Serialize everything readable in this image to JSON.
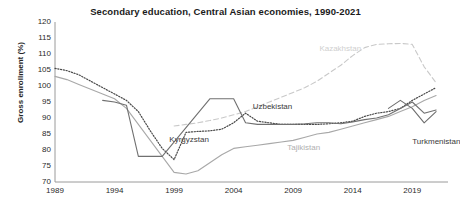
{
  "chart_data": {
    "type": "line",
    "title": "Secondary education, Central Asian economies, 1990-2021",
    "xlabel": "",
    "ylabel": "Gross enrollment (%)",
    "xlim": [
      1989,
      2022
    ],
    "ylim": [
      70,
      120
    ],
    "ytick_step": 5,
    "yticks": [
      120,
      115,
      110,
      105,
      100,
      95,
      90,
      85,
      80,
      75,
      70
    ],
    "xticks": [
      1989,
      1994,
      1999,
      2004,
      2009,
      2014,
      2019
    ],
    "grid": false,
    "legend_position": "inline-annotations",
    "colors": {
      "kazakhstan": "#c9c9c9",
      "kyrgyzstan": "#4a4a4a",
      "tajikistan": "#a8a8a8",
      "turkmenistan": "#6e6e6e",
      "uzbekistan": "#707070",
      "axis": "#9a9a9a",
      "text": "#1c1c1c"
    },
    "series": [
      {
        "name": "Kazakhstan",
        "style": "dashed",
        "color": "#c9c9c9",
        "label_x": 2011.2,
        "label_y": 111.5,
        "x": [
          1999,
          2000,
          2001,
          2002,
          2003,
          2004,
          2005,
          2006,
          2007,
          2008,
          2009,
          2010,
          2011,
          2012,
          2013,
          2014,
          2015,
          2016,
          2017,
          2018,
          2019,
          2020,
          2021
        ],
        "values": [
          87.5,
          88.0,
          88.5,
          89.2,
          90.0,
          91.0,
          92.0,
          93.5,
          95.0,
          96.5,
          98.0,
          99.5,
          101.5,
          104.0,
          106.5,
          109.5,
          112.0,
          113.0,
          113.2,
          113.3,
          113.0,
          106.0,
          101.0
        ]
      },
      {
        "name": "Kyrgyzstan",
        "style": "dotted",
        "color": "#4a4a4a",
        "label_x": 1998.6,
        "label_y": 83.0,
        "x": [
          1989,
          1990,
          1991,
          1992,
          1993,
          1994,
          1995,
          1996,
          1997,
          1998,
          1999,
          2000,
          2001,
          2002,
          2003,
          2004,
          2005,
          2006,
          2007,
          2008,
          2009,
          2010,
          2011,
          2012,
          2013,
          2014,
          2015,
          2016,
          2017,
          2018,
          2019,
          2020,
          2021
        ],
        "values": [
          105.5,
          104.8,
          103.5,
          101.5,
          99.5,
          97.5,
          95.5,
          92.0,
          86.0,
          80.5,
          77.0,
          85.5,
          85.8,
          86.0,
          86.5,
          88.5,
          91.5,
          89.0,
          88.5,
          88.0,
          88.0,
          88.0,
          88.0,
          88.2,
          88.5,
          89.0,
          90.5,
          91.5,
          92.0,
          93.0,
          95.5,
          97.5,
          99.5
        ]
      },
      {
        "name": "Tajikistan",
        "style": "solid",
        "color": "#a8a8a8",
        "label_x": 2008.5,
        "label_y": 80.5,
        "x": [
          1989,
          1990,
          1991,
          1992,
          1993,
          1994,
          1995,
          1996,
          1997,
          1998,
          1999,
          2000,
          2001,
          2002,
          2003,
          2004,
          2005,
          2006,
          2007,
          2008,
          2009,
          2010,
          2011,
          2012,
          2013,
          2014,
          2015,
          2016,
          2017,
          2018,
          2019,
          2020,
          2021
        ],
        "values": [
          103.0,
          102.0,
          100.5,
          99.0,
          97.5,
          96.0,
          93.0,
          88.0,
          83.0,
          78.0,
          73.0,
          72.5,
          73.5,
          76.0,
          78.5,
          80.5,
          81.0,
          81.5,
          82.0,
          82.5,
          83.0,
          84.0,
          85.0,
          85.5,
          86.5,
          87.5,
          88.5,
          89.5,
          90.5,
          92.0,
          93.5,
          95.5,
          97.0
        ]
      },
      {
        "name": "Turkmenistan",
        "style": "solid",
        "color": "#6e6e6e",
        "label_x": 2019.0,
        "label_y": 82.5,
        "x": [
          2017,
          2018,
          2019,
          2020,
          2021
        ],
        "values": [
          93.0,
          95.5,
          93.0,
          88.5,
          92.0
        ]
      },
      {
        "name": "Uzbekistan",
        "style": "solid",
        "color": "#707070",
        "label_x": 2005.6,
        "label_y": 93.5,
        "x": [
          1993,
          1994,
          1995,
          1996,
          1997,
          1998,
          2002,
          2003,
          2004,
          2005,
          2006,
          2007,
          2008,
          2009,
          2010,
          2011,
          2012,
          2013,
          2014,
          2015,
          2016,
          2017,
          2018,
          2019,
          2020,
          2021
        ],
        "values": [
          95.5,
          95.0,
          94.0,
          78.0,
          78.0,
          78.0,
          96.0,
          96.0,
          96.0,
          88.5,
          88.0,
          88.0,
          88.0,
          88.0,
          88.2,
          88.5,
          88.5,
          88.2,
          88.8,
          89.5,
          90.0,
          91.0,
          93.0,
          95.0,
          91.5,
          92.5
        ]
      }
    ]
  }
}
